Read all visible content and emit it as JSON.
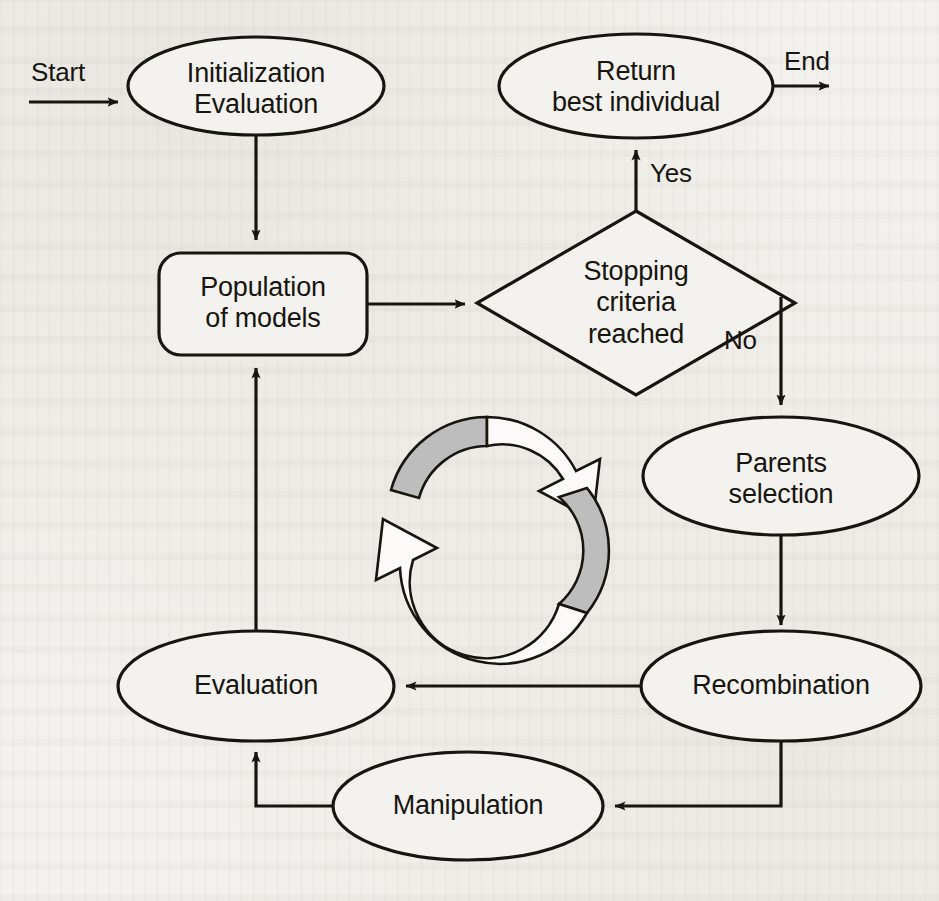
{
  "diagram": {
    "type": "flowchart",
    "colors": {
      "stroke": "#17150f",
      "background": "#f4f2ee",
      "node_fill": "#f4f2ee",
      "cycle_icon_fill_gray": "#b9b9b9",
      "cycle_icon_fill_white": "#fbfaf8"
    },
    "nodes": [
      {
        "id": "initialization",
        "shape": "ellipse",
        "label": "Initialization\nEvaluation"
      },
      {
        "id": "return-best",
        "shape": "ellipse",
        "label": "Return\nbest individual"
      },
      {
        "id": "population",
        "shape": "rounded-rectangle",
        "label": "Population\nof models"
      },
      {
        "id": "stopping-criteria",
        "shape": "diamond",
        "label": "Stopping\ncriteria\nreached"
      },
      {
        "id": "parents-selection",
        "shape": "ellipse",
        "label": "Parents\nselection"
      },
      {
        "id": "recombination",
        "shape": "ellipse",
        "label": "Recombination"
      },
      {
        "id": "manipulation",
        "shape": "ellipse",
        "label": "Manipulation"
      },
      {
        "id": "evaluation",
        "shape": "ellipse",
        "label": "Evaluation"
      }
    ],
    "edge_labels": {
      "start": "Start",
      "end": "End",
      "yes": "Yes",
      "no": "No"
    },
    "edges": [
      {
        "from": "start-terminal",
        "to": "initialization",
        "label": "Start"
      },
      {
        "from": "initialization",
        "to": "population",
        "label": ""
      },
      {
        "from": "population",
        "to": "stopping-criteria",
        "label": ""
      },
      {
        "from": "stopping-criteria",
        "to": "return-best",
        "label": "Yes"
      },
      {
        "from": "return-best",
        "to": "end-terminal",
        "label": "End"
      },
      {
        "from": "stopping-criteria",
        "to": "parents-selection",
        "label": "No"
      },
      {
        "from": "parents-selection",
        "to": "recombination",
        "label": ""
      },
      {
        "from": "recombination",
        "to": "evaluation",
        "label": ""
      },
      {
        "from": "recombination",
        "to": "manipulation",
        "label": ""
      },
      {
        "from": "manipulation",
        "to": "evaluation",
        "label": ""
      },
      {
        "from": "evaluation",
        "to": "population",
        "label": ""
      }
    ],
    "decoration": {
      "cycle_icon": "circular-refresh-arrows-icon"
    }
  }
}
